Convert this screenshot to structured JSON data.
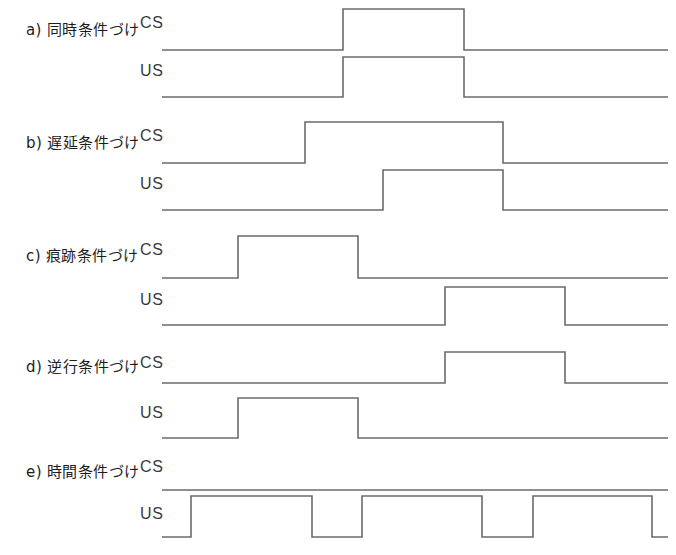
{
  "figure": {
    "title": "",
    "stroke_color": "#6b6b6b",
    "text_color": "#1d1d1d",
    "background": "#ffffff",
    "trace_label_cs": "CS",
    "trace_label_us": "US"
  },
  "panels": [
    {
      "id": "a",
      "label": "a) 同時条件づけ",
      "cs_label": "CS",
      "us_label": "US",
      "cs_baseline_y": 50,
      "us_baseline_y": 97,
      "cs_top_y": 9,
      "us_top_y": 57,
      "x_start": 162,
      "x_end": 668,
      "cs_pulses": [
        [
          343,
          464
        ]
      ],
      "us_pulses": [
        [
          343,
          464
        ]
      ]
    },
    {
      "id": "b",
      "label": "b) 遅延条件づけ",
      "cs_label": "CS",
      "us_label": "US",
      "cs_baseline_y": 163,
      "us_baseline_y": 210,
      "cs_top_y": 122,
      "us_top_y": 170,
      "x_start": 162,
      "x_end": 668,
      "cs_pulses": [
        [
          305,
          503
        ]
      ],
      "us_pulses": [
        [
          383,
          503
        ]
      ]
    },
    {
      "id": "c",
      "label": "c) 痕跡条件づけ",
      "cs_label": "CS",
      "us_label": "US",
      "cs_baseline_y": 278,
      "us_baseline_y": 325,
      "cs_top_y": 236,
      "us_top_y": 287,
      "x_start": 162,
      "x_end": 668,
      "cs_pulses": [
        [
          238,
          358
        ]
      ],
      "us_pulses": [
        [
          445,
          565
        ]
      ]
    },
    {
      "id": "d",
      "label": "d) 逆行条件づけ",
      "cs_label": "CS",
      "us_label": "US",
      "cs_baseline_y": 383,
      "us_baseline_y": 438,
      "cs_top_y": 352,
      "us_top_y": 398,
      "x_start": 162,
      "x_end": 668,
      "cs_pulses": [
        [
          445,
          565
        ]
      ],
      "us_pulses": [
        [
          238,
          358
        ]
      ]
    },
    {
      "id": "e",
      "label": "e) 時間条件づけ",
      "cs_label": "CS",
      "us_label": "US",
      "cs_baseline_y": 490,
      "us_baseline_y": 537,
      "cs_top_y": 490,
      "us_top_y": 496,
      "x_start": 162,
      "x_end": 668,
      "cs_pulses": [],
      "us_pulses": [
        [
          191,
          312
        ],
        [
          362,
          482
        ],
        [
          533,
          652
        ]
      ]
    }
  ],
  "panel_label_positions": [
    {
      "id": "a",
      "y": 18,
      "cs_label_y": 14,
      "us_label_y": 62
    },
    {
      "id": "b",
      "y": 131,
      "cs_label_y": 127,
      "us_label_y": 175
    },
    {
      "id": "c",
      "y": 244,
      "cs_label_y": 241,
      "us_label_y": 291
    },
    {
      "id": "d",
      "y": 355,
      "cs_label_y": 354,
      "us_label_y": 404
    },
    {
      "id": "e",
      "y": 460,
      "cs_label_y": 458,
      "us_label_y": 505
    }
  ]
}
